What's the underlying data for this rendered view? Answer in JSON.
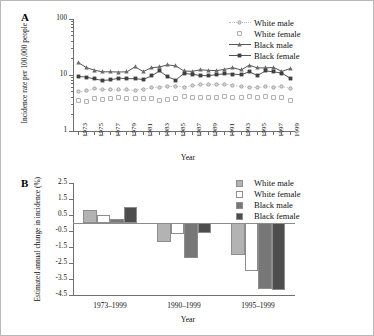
{
  "figure": {
    "panel_a_letter": "A",
    "panel_b_letter": "B"
  },
  "colors": {
    "white_male": "#b3b3b3",
    "white_female": "#ffffff",
    "black_male": "#777777",
    "black_female": "#4d4d4d",
    "axis": "#6f6f6f",
    "frame": "#b9b9b9",
    "text": "#111111"
  },
  "chart_data": [
    {
      "type": "line",
      "panel": "A",
      "title": "",
      "xlabel": "Year",
      "ylabel": "Incidence rate per 100,000 people",
      "yscale": "log",
      "ylim": [
        1,
        100
      ],
      "ytick_labels": [
        "100",
        "10",
        "1"
      ],
      "ytick_values": [
        100,
        10,
        1
      ],
      "grid": false,
      "legend_position": "top-right",
      "x": [
        1973,
        1974,
        1975,
        1976,
        1977,
        1978,
        1979,
        1980,
        1981,
        1982,
        1983,
        1984,
        1985,
        1986,
        1987,
        1988,
        1989,
        1990,
        1991,
        1992,
        1993,
        1994,
        1995,
        1996,
        1997,
        1998,
        1999
      ],
      "xtick_labels": [
        "1973",
        "1975",
        "1977",
        "1979",
        "1981",
        "1983",
        "1985",
        "1987",
        "1989",
        "1991",
        "1993",
        "1995",
        "1997",
        "1999"
      ],
      "series": [
        {
          "name": "White male",
          "marker": "circle-open",
          "line": "dotted",
          "color": "#b3b3b3",
          "values": [
            5.0,
            5.2,
            5.7,
            5.5,
            5.4,
            5.4,
            5.4,
            5.3,
            5.6,
            5.9,
            6.1,
            6.2,
            6.3,
            6.1,
            6.4,
            6.8,
            6.7,
            6.7,
            6.9,
            6.5,
            6.3,
            6.1,
            6.0,
            6.2,
            6.1,
            6.2,
            5.8
          ]
        },
        {
          "name": "White female",
          "marker": "square-open",
          "line": "none",
          "color": "#ffffff",
          "values": [
            3.5,
            3.4,
            3.8,
            3.7,
            3.8,
            3.9,
            3.8,
            3.8,
            3.8,
            3.8,
            3.5,
            3.7,
            3.8,
            4.2,
            3.9,
            3.9,
            3.9,
            4.0,
            4.2,
            4.0,
            3.9,
            4.1,
            3.9,
            4.1,
            4.0,
            3.9,
            3.5
          ]
        },
        {
          "name": "Black male",
          "marker": "triangle-filled",
          "line": "solid",
          "color": "#777777",
          "values": [
            16.8,
            13.6,
            12.2,
            11.4,
            11.4,
            11.3,
            11.4,
            14.0,
            11.5,
            13.5,
            13.9,
            15.2,
            14.5,
            11.8,
            11.6,
            12.4,
            12.1,
            12.0,
            12.6,
            13.5,
            12.3,
            15.0,
            13.4,
            13.4,
            13.6,
            11.6,
            13.0
          ]
        },
        {
          "name": "Black female",
          "marker": "square-filled",
          "line": "solid",
          "color": "#4d4d4d",
          "values": [
            9.4,
            9.2,
            8.5,
            8.0,
            8.2,
            8.8,
            8.6,
            8.6,
            8.3,
            9.6,
            11.8,
            9.3,
            8.1,
            10.7,
            10.3,
            9.8,
            9.7,
            10.2,
            10.5,
            10.4,
            10.1,
            11.4,
            9.8,
            11.8,
            11.4,
            10.8,
            8.8
          ]
        }
      ]
    },
    {
      "type": "bar",
      "panel": "B",
      "title": "",
      "xlabel": "Year",
      "ylabel": "Estimated annual change in incidence (%)",
      "ylim": [
        -4.5,
        2.5
      ],
      "ytick_labels": [
        "2.5",
        "1.5",
        "0.5",
        "-0.5",
        "-1.5",
        "-2.5",
        "-3.5",
        "-4.5"
      ],
      "ytick_values": [
        2.5,
        1.5,
        0.5,
        -0.5,
        -1.5,
        -2.5,
        -3.5,
        -4.5
      ],
      "grid": false,
      "legend_position": "top-right",
      "categories": [
        "1973–1999",
        "1990–1999",
        "1995–1999"
      ],
      "series": [
        {
          "name": "White male",
          "color": "#b3b3b3",
          "values": [
            0.8,
            -1.2,
            -2.0
          ]
        },
        {
          "name": "White female",
          "color": "#ffffff",
          "values": [
            0.5,
            -0.7,
            -3.0
          ]
        },
        {
          "name": "Black male",
          "color": "#777777",
          "values": [
            0.25,
            -2.2,
            -4.1
          ]
        },
        {
          "name": "Black female",
          "color": "#4d4d4d",
          "values": [
            1.0,
            -0.6,
            -4.2
          ]
        }
      ]
    }
  ]
}
